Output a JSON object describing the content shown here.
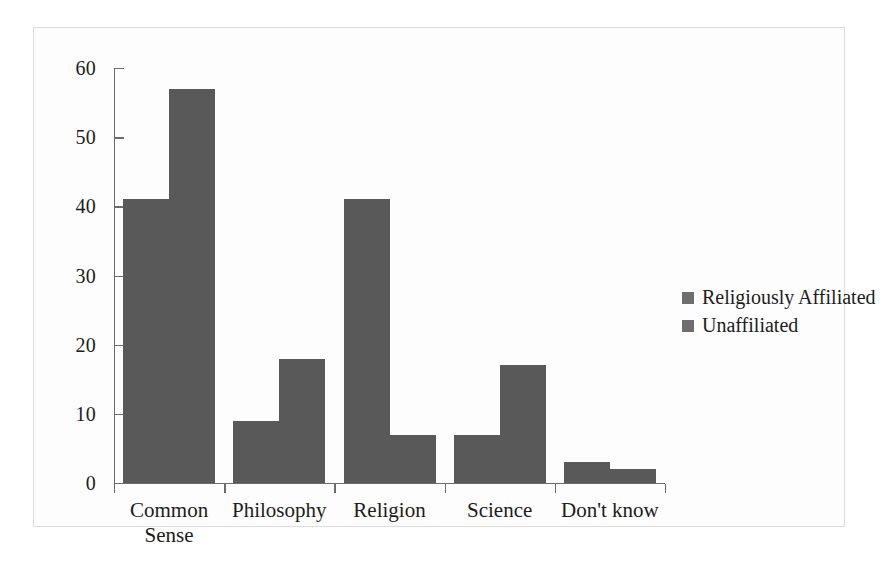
{
  "chart_data": {
    "type": "bar",
    "title": "",
    "xlabel": "",
    "ylabel": "",
    "ylim": [
      0,
      60
    ],
    "yticks": [
      0,
      10,
      20,
      30,
      40,
      50,
      60
    ],
    "grid": false,
    "legend_position": "right",
    "categories": [
      "Common\nSense",
      "Philosophy",
      "Religion",
      "Science",
      "Don't know"
    ],
    "series": [
      {
        "name": "Religiously Affiliated",
        "values": [
          41,
          9,
          41,
          7,
          3
        ]
      },
      {
        "name": "Unaffiliated",
        "values": [
          57,
          18,
          7,
          17,
          2
        ]
      }
    ]
  },
  "colors": {
    "bar_fill": "#595959",
    "legend_swatch": "#6e6e6e",
    "axis": "#6b6b6b",
    "text": "#1c1c1c",
    "frame_border": "#dcdcdc",
    "background": "#fdfdfd"
  }
}
